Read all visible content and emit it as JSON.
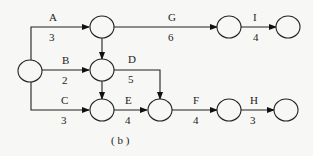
{
  "caption": "( b )",
  "nodes": [
    {
      "id": "n1",
      "cx": 30,
      "cy": 71
    },
    {
      "id": "n2",
      "cx": 102,
      "cy": 27
    },
    {
      "id": "n3",
      "cx": 102,
      "cy": 70
    },
    {
      "id": "n4",
      "cx": 102,
      "cy": 110
    },
    {
      "id": "n5",
      "cx": 160,
      "cy": 110
    },
    {
      "id": "n6",
      "cx": 229,
      "cy": 27
    },
    {
      "id": "n7",
      "cx": 288,
      "cy": 27
    },
    {
      "id": "n8",
      "cx": 229,
      "cy": 110
    },
    {
      "id": "n9",
      "cx": 286,
      "cy": 110
    }
  ],
  "activities": [
    {
      "name": "A",
      "duration": "3"
    },
    {
      "name": "B",
      "duration": "2"
    },
    {
      "name": "C",
      "duration": "3"
    },
    {
      "name": "D",
      "duration": "5"
    },
    {
      "name": "E",
      "duration": "4"
    },
    {
      "name": "F",
      "duration": "4"
    },
    {
      "name": "G",
      "duration": "6"
    },
    {
      "name": "H",
      "duration": "3"
    },
    {
      "name": "I",
      "duration": "4"
    }
  ]
}
